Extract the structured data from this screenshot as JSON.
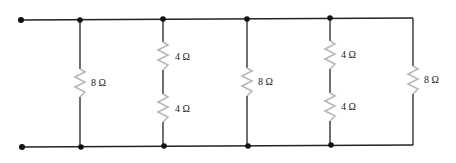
{
  "diagram": {
    "type": "parallel resistor network",
    "colors": {
      "wire": "#222222",
      "resistor": "#b8b8b8",
      "node": "#111111"
    },
    "terminals": [
      {
        "id": "terminal-top",
        "x": 21,
        "y": 20
      },
      {
        "id": "terminal-bottom",
        "x": 22,
        "y": 147
      }
    ],
    "branches": [
      {
        "id": "branch-1",
        "x": 80,
        "resistors": [
          {
            "label": "8 Ω",
            "value": 8,
            "cy": 83
          }
        ]
      },
      {
        "id": "branch-2",
        "x": 163,
        "resistors": [
          {
            "label": "4 Ω",
            "value": 4,
            "cy": 56
          },
          {
            "label": "4 Ω",
            "value": 4,
            "cy": 108
          }
        ]
      },
      {
        "id": "branch-3",
        "x": 247,
        "resistors": [
          {
            "label": "8 Ω",
            "value": 8,
            "cy": 82
          }
        ]
      },
      {
        "id": "branch-4",
        "x": 330,
        "resistors": [
          {
            "label": "4 Ω",
            "value": 4,
            "cy": 55
          },
          {
            "label": "4 Ω",
            "value": 4,
            "cy": 107
          }
        ]
      },
      {
        "id": "branch-5",
        "x": 413,
        "resistors": [
          {
            "label": "8 Ω",
            "value": 8,
            "cy": 80
          }
        ]
      }
    ],
    "labels": {
      "b1r1": "8 Ω",
      "b2r1": "4 Ω",
      "b2r2": "4 Ω",
      "b3r1": "8 Ω",
      "b4r1": "4 Ω",
      "b4r2": "4 Ω",
      "b5r1": "8 Ω"
    }
  }
}
